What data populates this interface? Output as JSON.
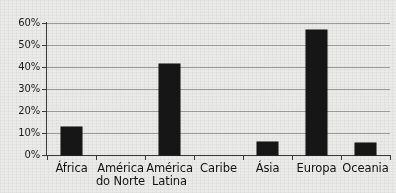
{
  "chart_data": {
    "type": "bar",
    "title": "",
    "subtitle": "",
    "xlabel": "",
    "ylabel": "",
    "categories": [
      "África",
      "América do Norte",
      "América Latina",
      "Caribe",
      "Ásia",
      "Europa",
      "Oceania"
    ],
    "category_lines": [
      [
        "África",
        ""
      ],
      [
        "América",
        "do Norte"
      ],
      [
        "América",
        "Latina"
      ],
      [
        "Caribe",
        ""
      ],
      [
        "Ásia",
        ""
      ],
      [
        "Europa",
        ""
      ],
      [
        "Oceania",
        ""
      ]
    ],
    "values": [
      12.7,
      0,
      41.5,
      0,
      5.8,
      56.8,
      5.5
    ],
    "value_format": "percent",
    "ylim": [
      0,
      60
    ],
    "ytick_values": [
      0,
      10,
      20,
      30,
      40,
      50,
      60
    ],
    "ytick_labels": [
      "0%",
      "10%",
      "20%",
      "30%",
      "40%",
      "50%",
      "60%"
    ],
    "grid": true,
    "grid_axis": "y",
    "legend": false,
    "legend_position": "none",
    "bar_color": "#181818",
    "background_color": "#ebebe9",
    "axis_color": "#3a3a3a",
    "grid_color": "#9a9a9a",
    "bar_width_ratio": 0.42
  }
}
